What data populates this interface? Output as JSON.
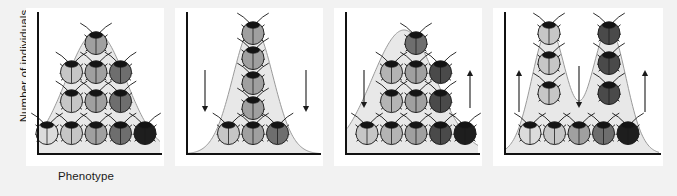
{
  "figure": {
    "background_color": "#f2f2f2",
    "panel_background_color": "#ffffff",
    "axis_color": "#111111",
    "curve_stroke_color": "#9a9a9a",
    "curve_fill_color": "#e8e8e8",
    "arrow_color": "#1a1a1a",
    "axes": {
      "y_label": "Number of individuals",
      "x_label": "Phenotype"
    },
    "beetle_palette": {
      "lightest": "#dcdcdc",
      "light": "#c6c6c6",
      "medium_light": "#b4b4b4",
      "medium": "#a0a0a0",
      "medium_dark": "#6e6e6e",
      "dark": "#4a4a4a",
      "darkest": "#1e1e1e",
      "head_color": "#141414",
      "outline_color": "#1a1a1a"
    },
    "panels": [
      {
        "index": 1,
        "name": "original-population",
        "selection_type": "original population",
        "curve_shape": "normal",
        "arrows": [],
        "beetle_rows": [
          {
            "row": "top",
            "shades": [
              "medium"
            ]
          },
          {
            "row": "upper-middle",
            "shades": [
              "light",
              "medium",
              "medium_dark"
            ]
          },
          {
            "row": "lower-middle",
            "shades": [
              "light",
              "medium",
              "medium_dark"
            ]
          },
          {
            "row": "bottom",
            "shades": [
              "lightest",
              "light",
              "medium",
              "medium_dark",
              "darkest"
            ]
          }
        ]
      },
      {
        "index": 2,
        "name": "stabilizing-selection",
        "selection_type": "stabilizing selection",
        "curve_shape": "narrow-tall-peak",
        "arrows": [
          {
            "direction": "down",
            "position": "left"
          },
          {
            "direction": "down",
            "position": "right"
          }
        ],
        "beetle_rows": [
          {
            "row": "top",
            "shades": [
              "medium"
            ]
          },
          {
            "row": "upper-middle",
            "shades": [
              "medium"
            ]
          },
          {
            "row": "lower-middle",
            "shades": [
              "medium"
            ]
          },
          {
            "row": "fourth",
            "shades": [
              "medium"
            ]
          },
          {
            "row": "bottom",
            "shades": [
              "light",
              "medium",
              "medium_dark"
            ]
          }
        ]
      },
      {
        "index": 3,
        "name": "directional-selection",
        "selection_type": "directional selection",
        "curve_shape": "shifted-right",
        "arrows": [
          {
            "direction": "down",
            "position": "left"
          },
          {
            "direction": "up",
            "position": "right"
          }
        ],
        "beetle_rows": [
          {
            "row": "top",
            "shades": [
              "medium_dark"
            ]
          },
          {
            "row": "upper-middle",
            "shades": [
              "medium_light",
              "medium",
              "dark"
            ]
          },
          {
            "row": "lower-middle",
            "shades": [
              "medium_light",
              "medium",
              "dark"
            ]
          },
          {
            "row": "bottom",
            "shades": [
              "light",
              "medium_light",
              "medium",
              "dark",
              "darkest"
            ]
          }
        ]
      },
      {
        "index": 4,
        "name": "disruptive-selection",
        "selection_type": "disruptive selection",
        "curve_shape": "bimodal",
        "arrows": [
          {
            "direction": "up",
            "position": "left"
          },
          {
            "direction": "down",
            "position": "center"
          },
          {
            "direction": "up",
            "position": "right"
          }
        ],
        "beetle_rows": [
          {
            "row": "top",
            "shades": [
              "light",
              "dark"
            ]
          },
          {
            "row": "upper-middle",
            "shades": [
              "light",
              "dark"
            ]
          },
          {
            "row": "lower-middle",
            "shades": [
              "light",
              "dark"
            ]
          },
          {
            "row": "bottom",
            "shades": [
              "lightest",
              "light",
              "medium",
              "medium_dark",
              "darkest"
            ]
          }
        ]
      }
    ]
  }
}
